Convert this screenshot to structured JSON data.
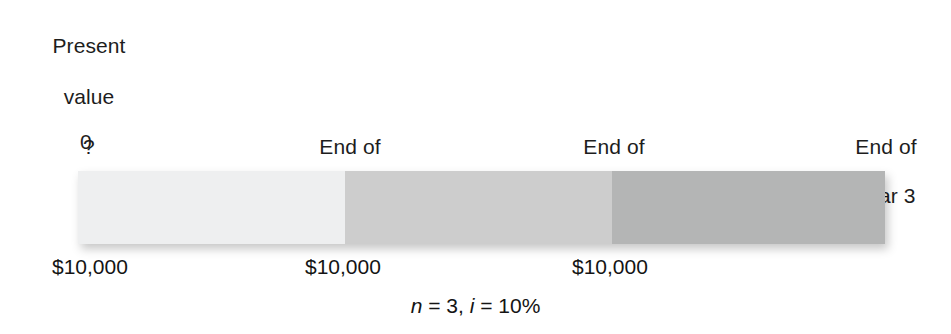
{
  "diagram": {
    "background_color": "#ffffff",
    "text_color": "#1a1a1a"
  },
  "present_value": {
    "line1": "Present",
    "line2": "value",
    "line3": "?"
  },
  "timeline": {
    "tick_0": "0",
    "ticks": [
      {
        "line1": "End of",
        "line2": "year 1"
      },
      {
        "line1": "End of",
        "line2": "year 2"
      },
      {
        "line1": "End of",
        "line2": "year 3"
      }
    ]
  },
  "cash_flows": [
    {
      "label": "$10,000"
    },
    {
      "label": "$10,000"
    },
    {
      "label": "$10,000"
    }
  ],
  "assumptions": {
    "n_symbol": "n",
    "n_equals": "=",
    "n_value": "3,",
    "i_symbol": "i",
    "i_equals": "=",
    "i_value": "10%",
    "full_text": "n = 3, i = 10%"
  },
  "bar_segments": [
    {
      "name": "year-1-segment",
      "color": "#eeeff0"
    },
    {
      "name": "year-2-segment",
      "color": "#cdcdcd"
    },
    {
      "name": "year-3-segment",
      "color": "#b4b5b5"
    }
  ],
  "chart_data": {
    "type": "bar",
    "categories": [
      "End of year 1",
      "End of year 2",
      "End of year 3"
    ],
    "values": [
      10000,
      10000,
      10000
    ],
    "value_labels": [
      "$10,000",
      "$10,000",
      "$10,000"
    ],
    "xlabel": "",
    "ylabel": "",
    "grid": false,
    "legend": false,
    "annotations": [
      "Present value ?",
      "0",
      "n = 3, i = 10%"
    ],
    "series": [
      {
        "name": "Annual cash flow",
        "values": [
          10000,
          10000,
          10000
        ]
      }
    ],
    "segment_colors": [
      "#eeeff0",
      "#cdcdcd",
      "#b4b5b5"
    ],
    "periods": 3,
    "interest_rate_percent": 10
  }
}
